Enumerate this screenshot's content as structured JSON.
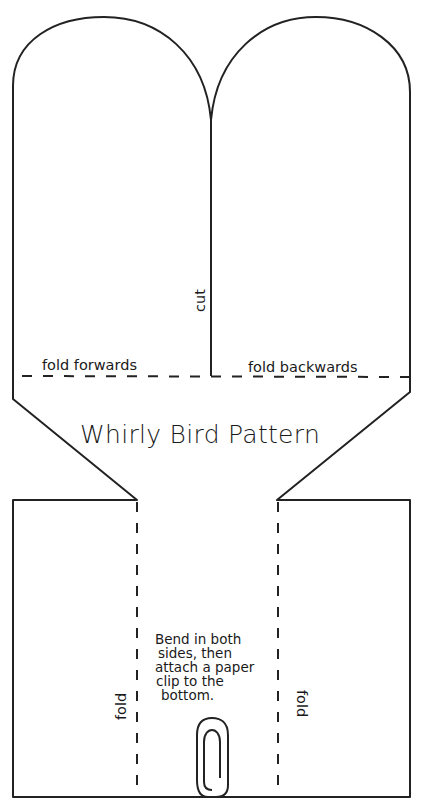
{
  "title": "Whirly Bird Pattern",
  "labels": {
    "cut": "cut",
    "fold_forwards": "fold forwards",
    "fold_backwards": "fold backwards",
    "fold_left": "fold",
    "fold_right": "fold"
  },
  "instructions": {
    "lines": [
      "Bend in both",
      "sides, then",
      "attach a paper",
      "clip to the",
      "bottom."
    ]
  },
  "icons": {
    "paper_clip": "paper-clip-icon"
  },
  "colors": {
    "line": "#222222",
    "background": "#ffffff"
  }
}
